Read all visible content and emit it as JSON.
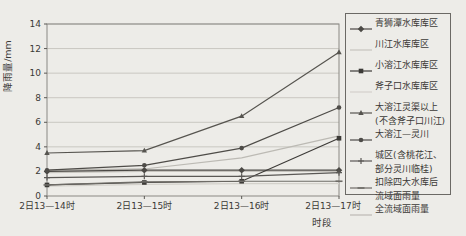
{
  "figure": {
    "bg": "#edece8",
    "grid_color": "#c9c7c1",
    "border_color": "#8a8883",
    "axis_color": "#5a5854",
    "text_color": "#3b3936"
  },
  "chart_data": {
    "type": "line",
    "title": "",
    "xlabel": "时段",
    "ylabel": "降雨量/mm",
    "ylim": [
      0,
      14
    ],
    "yticks": [
      0,
      2,
      4,
      6,
      8,
      10,
      12,
      14
    ],
    "grid": "horizontal",
    "legend_position": "right",
    "categories": [
      "2日13—14时",
      "2日13—15时",
      "2日13—16时",
      "2日13—17时"
    ],
    "series": [
      {
        "name": "青狮潭水库库区",
        "legend_lines": [
          "青狮潭水库库区"
        ],
        "values": [
          2.0,
          2.1,
          2.1,
          2.1
        ],
        "color": "#4b4945",
        "marker": "diamond"
      },
      {
        "name": "川江水库库区",
        "legend_lines": [
          "川江水库库区"
        ],
        "values": [
          1.9,
          2.0,
          2.0,
          2.0
        ],
        "color": "#c6c4be",
        "marker": "none"
      },
      {
        "name": "小溶江水库库区",
        "legend_lines": [
          "小溶江水库库区"
        ],
        "values": [
          0.9,
          1.1,
          1.2,
          4.7
        ],
        "color": "#3c3a37",
        "marker": "square"
      },
      {
        "name": "斧子口水库库区",
        "legend_lines": [
          "斧子口水库库区"
        ],
        "values": [
          0.8,
          0.95,
          1.0,
          1.0
        ],
        "color": "#d3d1cb",
        "marker": "none"
      },
      {
        "name": "大溶江灵渠以上(不含斧子口川江)",
        "legend_lines": [
          "大溶江灵渠以上",
          "(不含斧子口川江)"
        ],
        "values": [
          3.5,
          3.7,
          6.5,
          11.7
        ],
        "color": "#56544f",
        "marker": "triangle"
      },
      {
        "name": "大溶江—灵川",
        "legend_lines": [
          "大溶江—灵川"
        ],
        "values": [
          2.1,
          2.5,
          3.9,
          7.2
        ],
        "color": "#4e4c48",
        "marker": "circle"
      },
      {
        "name": "城区(含桃花江、部分灵川临桂)",
        "legend_lines": [
          "城区(含桃花江、",
          "部分灵川临桂)"
        ],
        "values": [
          1.5,
          1.6,
          1.6,
          1.9
        ],
        "color": "#5a5855",
        "marker": "plus"
      },
      {
        "name": "扣除四大水库后流域面雨量",
        "legend_lines": [
          "扣除四大水库后",
          "流域面雨量"
        ],
        "values": [
          0.9,
          1.15,
          1.2,
          1.2
        ],
        "color": "#6e6c67",
        "marker": "dash"
      },
      {
        "name": "全流域面雨量",
        "legend_lines": [
          "全流域面雨量"
        ],
        "values": [
          2.1,
          2.2,
          3.1,
          4.9
        ],
        "color": "#bcbab4",
        "marker": "none"
      }
    ]
  }
}
